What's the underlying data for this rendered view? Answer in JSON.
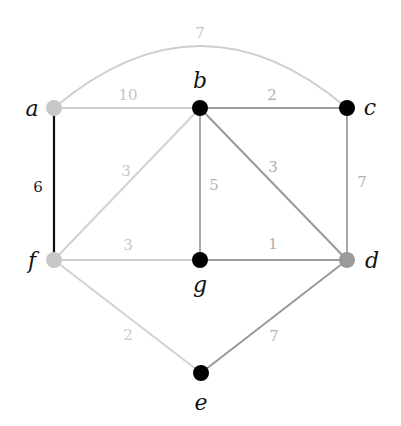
{
  "graph": {
    "title": "",
    "nodes": [
      {
        "id": "a",
        "label": "a",
        "x": 54,
        "y": 108,
        "color": "#c8c8c8",
        "lx": 32,
        "ly": 116
      },
      {
        "id": "b",
        "label": "b",
        "x": 200,
        "y": 108,
        "color": "#000000",
        "lx": 200,
        "ly": 88
      },
      {
        "id": "c",
        "label": "c",
        "x": 347,
        "y": 108,
        "color": "#000000",
        "lx": 370,
        "ly": 115
      },
      {
        "id": "f",
        "label": "f",
        "x": 54,
        "y": 260,
        "color": "#c8c8c8",
        "lx": 32,
        "ly": 268
      },
      {
        "id": "g",
        "label": "g",
        "x": 200,
        "y": 260,
        "color": "#000000",
        "lx": 200,
        "ly": 292
      },
      {
        "id": "d",
        "label": "d",
        "x": 347,
        "y": 260,
        "color": "#9a9a9a",
        "lx": 372,
        "ly": 268
      },
      {
        "id": "e",
        "label": "e",
        "x": 201,
        "y": 373,
        "color": "#000000",
        "lx": 201,
        "ly": 410
      }
    ],
    "edges": [
      {
        "from": "a",
        "to": "c",
        "weight": "7",
        "color": "#cfcfcf",
        "curved": true,
        "wx": 200,
        "wy": 38,
        "wcolor": "#c4c4c4"
      },
      {
        "from": "a",
        "to": "b",
        "weight": "10",
        "color": "#d0d0d0",
        "wx": 128,
        "wy": 100,
        "wcolor": "#c4c4c4"
      },
      {
        "from": "b",
        "to": "c",
        "weight": "2",
        "color": "#9c9c9c",
        "wx": 272,
        "wy": 100,
        "wcolor": "#b0b0b0"
      },
      {
        "from": "a",
        "to": "f",
        "weight": "6",
        "color": "#111111",
        "wx": 38,
        "wy": 192,
        "wcolor": "#222222"
      },
      {
        "from": "b",
        "to": "f",
        "weight": "3",
        "color": "#d2d2d2",
        "wx": 126,
        "wy": 176,
        "wcolor": "#c8c8c8"
      },
      {
        "from": "b",
        "to": "g",
        "weight": "5",
        "color": "#a8a8a8",
        "wx": 214,
        "wy": 190,
        "wcolor": "#b4b4b4"
      },
      {
        "from": "b",
        "to": "d",
        "weight": "3",
        "color": "#999999",
        "wx": 273,
        "wy": 172,
        "wcolor": "#b0b0b0"
      },
      {
        "from": "c",
        "to": "d",
        "weight": "7",
        "color": "#a6a6a6",
        "wx": 362,
        "wy": 187,
        "wcolor": "#b4b4b4"
      },
      {
        "from": "f",
        "to": "g",
        "weight": "3",
        "color": "#d0d0d0",
        "wx": 128,
        "wy": 250,
        "wcolor": "#c8c8c8"
      },
      {
        "from": "g",
        "to": "d",
        "weight": "1",
        "color": "#9c9c9c",
        "wx": 273,
        "wy": 249,
        "wcolor": "#b0b0b0"
      },
      {
        "from": "f",
        "to": "e",
        "weight": "2",
        "color": "#d2d2d2",
        "wx": 128,
        "wy": 340,
        "wcolor": "#cccccc"
      },
      {
        "from": "e",
        "to": "d",
        "weight": "7",
        "color": "#999999",
        "wx": 274,
        "wy": 341,
        "wcolor": "#b4b4b4"
      }
    ]
  }
}
